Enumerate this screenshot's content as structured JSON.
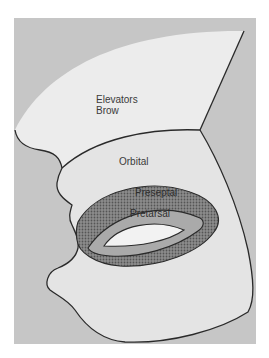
{
  "figure": {
    "type": "anatomical-diagram",
    "labels": {
      "brow_line1": "Elevators",
      "brow_line2": "Brow",
      "orbital": "Orbital",
      "preseptal": "Preseptal",
      "pretarsal": "Pretarsal"
    },
    "colors": {
      "page_background": "#ffffff",
      "frame_background": "#c4c4c4",
      "face_fill": "#e8e8e8",
      "orbital_fill": "#dedede",
      "preseptal_hatch_bg": "#8a8a8a",
      "preseptal_hatch_dot": "#5a5a5a",
      "pretarsal_fill": "#a9a9a9",
      "eye_opening_fill": "#f0f0f0",
      "outline": "#2a2a2a"
    }
  }
}
